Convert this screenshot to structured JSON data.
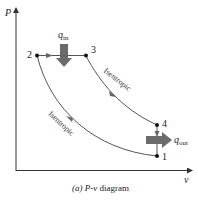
{
  "axes": {
    "y_label": "P",
    "x_label": "v"
  },
  "points": [
    {
      "id": "1",
      "label": "1",
      "x": 157,
      "y": 156
    },
    {
      "id": "2",
      "label": "2",
      "x": 37,
      "y": 55
    },
    {
      "id": "3",
      "label": "3",
      "x": 86,
      "y": 56
    },
    {
      "id": "4",
      "label": "4",
      "x": 157,
      "y": 125
    }
  ],
  "processes": [
    {
      "from": "2",
      "to": "3",
      "type": "constant pressure"
    },
    {
      "from": "3",
      "to": "4",
      "type": "isentropic",
      "label": "Isentropic"
    },
    {
      "from": "4",
      "to": "1",
      "type": "constant volume"
    },
    {
      "from": "1",
      "to": "2",
      "type": "isentropic",
      "label": "Isentropic"
    }
  ],
  "heat": {
    "in": {
      "symbol": "q",
      "subscript": "in"
    },
    "out": {
      "symbol": "q",
      "subscript": "out"
    }
  },
  "caption": {
    "prefix": "(a)",
    "title": "P-v",
    "suffix": "diagram"
  },
  "colors": {
    "curve": "#555555",
    "arrow": "#6b6b6b",
    "axis": "#333333",
    "point": "#111111"
  }
}
